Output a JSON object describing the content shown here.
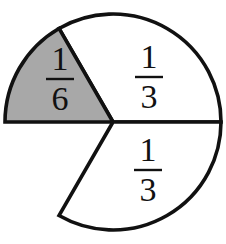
{
  "figure": {
    "name": "fraction-circle-diagram",
    "background_color": "#ffffff",
    "stroke_color": "#111111",
    "stroke_width": 3.6,
    "shaded_fill": "#a8a8a8",
    "unshaded_fill": "#ffffff",
    "center_x": 113,
    "center_y": 122,
    "radius": 108
  },
  "chart_data": {
    "type": "pie",
    "xlabel": "",
    "ylabel": "",
    "legend": "none",
    "grid": false,
    "total_parts": 6,
    "categories": [
      "1/6",
      "1/3",
      "1/3",
      "gap"
    ],
    "values": [
      0.1667,
      0.3333,
      0.3333,
      0.1667
    ],
    "slices": [
      {
        "label": "1/6",
        "numerator": "1",
        "denominator": "6",
        "value": 0.1667,
        "sixths": 1,
        "degrees": 60,
        "start_angle_deg": 120,
        "end_angle_deg": 180,
        "fill": "#a8a8a8",
        "shaded": true,
        "present": true,
        "label_x": 60,
        "label_y": 78
      },
      {
        "label": "1/3",
        "numerator": "1",
        "denominator": "3",
        "value": 0.3333,
        "sixths": 2,
        "degrees": 120,
        "start_angle_deg": 0,
        "end_angle_deg": 120,
        "fill": "#ffffff",
        "shaded": false,
        "present": true,
        "label_x": 148,
        "label_y": 76
      },
      {
        "label": "1/3",
        "numerator": "1",
        "denominator": "3",
        "value": 0.3333,
        "sixths": 2,
        "degrees": 120,
        "start_angle_deg": 240,
        "end_angle_deg": 360,
        "fill": "#ffffff",
        "shaded": false,
        "present": true,
        "label_x": 147,
        "label_y": 169
      },
      {
        "label": "",
        "numerator": "",
        "denominator": "",
        "value": 0.1667,
        "sixths": 1,
        "degrees": 60,
        "start_angle_deg": 180,
        "end_angle_deg": 240,
        "fill": "#ffffff",
        "shaded": false,
        "present": false,
        "label_x": 0,
        "label_y": 0
      }
    ]
  },
  "labels": {
    "shaded_sixth": {
      "numerator": "1",
      "denominator": "6"
    },
    "top_third": {
      "numerator": "1",
      "denominator": "3"
    },
    "bottom_third": {
      "numerator": "1",
      "denominator": "3"
    }
  }
}
